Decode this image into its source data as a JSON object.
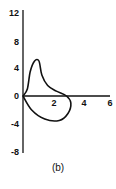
{
  "chart_data": {
    "type": "line",
    "title": "",
    "caption": "(b)",
    "xlabel": "",
    "ylabel": "",
    "xlim": [
      0,
      6
    ],
    "ylim": [
      -8,
      12
    ],
    "x_ticks": [
      "2",
      "4",
      "6"
    ],
    "y_ticks": [
      "12",
      "8",
      "4",
      "0",
      "-4",
      "-8"
    ],
    "grid": false,
    "legend": null,
    "series": [
      {
        "name": "closed loop curve",
        "closed": true,
        "points": [
          {
            "x": 0.0,
            "y": 0.0
          },
          {
            "x": 0.3,
            "y": 1.0
          },
          {
            "x": 0.5,
            "y": 3.5
          },
          {
            "x": 0.8,
            "y": 5.0
          },
          {
            "x": 1.1,
            "y": 5.0
          },
          {
            "x": 1.3,
            "y": 3.0
          },
          {
            "x": 1.7,
            "y": 1.5
          },
          {
            "x": 2.3,
            "y": 0.7
          },
          {
            "x": 3.0,
            "y": 0.0
          },
          {
            "x": 3.3,
            "y": -1.0
          },
          {
            "x": 3.1,
            "y": -2.5
          },
          {
            "x": 2.5,
            "y": -3.5
          },
          {
            "x": 1.5,
            "y": -3.3
          },
          {
            "x": 0.6,
            "y": -2.0
          },
          {
            "x": 0.0,
            "y": 0.0
          }
        ]
      }
    ],
    "colors": {
      "line": "#111111",
      "axes": "#111111",
      "background": "#ffffff"
    }
  }
}
